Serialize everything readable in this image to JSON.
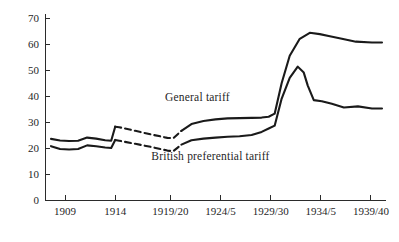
{
  "chart_data": {
    "type": "line",
    "title": "",
    "xlabel": "",
    "ylabel": "",
    "xlim": [
      1907,
      1941
    ],
    "ylim": [
      0,
      70
    ],
    "grid": false,
    "legend_position": "inline-annotations",
    "y_ticks": [
      0,
      10,
      20,
      30,
      40,
      50,
      60,
      70
    ],
    "y_tick_labels": [
      "0",
      "10",
      "20",
      "30",
      "40",
      "50",
      "60",
      "70"
    ],
    "x_ticks": [
      1909,
      1914,
      1919.5,
      1924.5,
      1929.5,
      1934.5,
      1939.5
    ],
    "x_tick_labels": [
      "1909",
      "1914",
      "1919/20",
      "1924/5",
      "1929/30",
      "1934/5",
      "1939/40"
    ],
    "series": [
      {
        "name": "General tariff",
        "label_text": "General tariff",
        "color": "#1a1a1a",
        "x": [
          1907.6,
          1908.5,
          1909.4,
          1910.3,
          1911.2,
          1912.1,
          1913.0,
          1913.6,
          1914.0,
          1914.4,
          1916.0,
          1917.6,
          1919.2,
          1919.8,
          1920.6,
          1921.6,
          1922.8,
          1924.0,
          1925.2,
          1926.4,
          1927.6,
          1928.6,
          1929.3,
          1929.9,
          1930.6,
          1931.4,
          1932.4,
          1933.4,
          1934.4,
          1935.4,
          1936.6,
          1938.0,
          1939.6,
          1940.6
        ],
        "y": [
          23.5,
          22.9,
          22.7,
          22.8,
          24.0,
          23.6,
          23.0,
          22.8,
          28.2,
          28.0,
          26.6,
          25.2,
          23.9,
          23.8,
          26.6,
          29.2,
          30.4,
          31.0,
          31.4,
          31.5,
          31.6,
          31.7,
          32.0,
          33.2,
          45.0,
          55.5,
          62.0,
          64.3,
          63.8,
          63.0,
          62.0,
          60.9,
          60.6,
          60.6
        ],
        "dashed_segment": {
          "x_start": 1914.0,
          "x_end": 1919.8
        }
      },
      {
        "name": "British preferential tariff",
        "label_text": "British preferential tariff",
        "color": "#1a1a1a",
        "x": [
          1907.6,
          1908.5,
          1909.4,
          1910.3,
          1911.2,
          1912.1,
          1913.0,
          1913.6,
          1914.0,
          1914.4,
          1916.0,
          1917.6,
          1919.2,
          1919.8,
          1920.6,
          1921.6,
          1922.8,
          1924.0,
          1925.2,
          1926.4,
          1927.6,
          1928.6,
          1929.3,
          1929.9,
          1930.6,
          1931.4,
          1932.2,
          1932.8,
          1933.2,
          1933.8,
          1934.6,
          1935.6,
          1936.8,
          1938.2,
          1939.6,
          1940.6
        ],
        "y": [
          20.7,
          19.6,
          19.4,
          19.6,
          21.0,
          20.7,
          20.2,
          20.0,
          23.1,
          22.8,
          21.6,
          20.4,
          19.0,
          18.8,
          21.3,
          23.0,
          23.6,
          24.0,
          24.3,
          24.5,
          25.0,
          26.2,
          27.5,
          28.6,
          39.0,
          47.0,
          51.3,
          49.0,
          44.0,
          38.4,
          38.0,
          37.0,
          35.6,
          36.0,
          35.2,
          35.2
        ],
        "dashed_segment": {
          "x_start": 1914.0,
          "x_end": 1919.8
        }
      }
    ],
    "annotations": [
      {
        "text": "General tariff",
        "x": 1922.2,
        "y": 38.0
      },
      {
        "text": "British preferential tariff",
        "x": 1923.5,
        "y": 15.5
      }
    ]
  }
}
